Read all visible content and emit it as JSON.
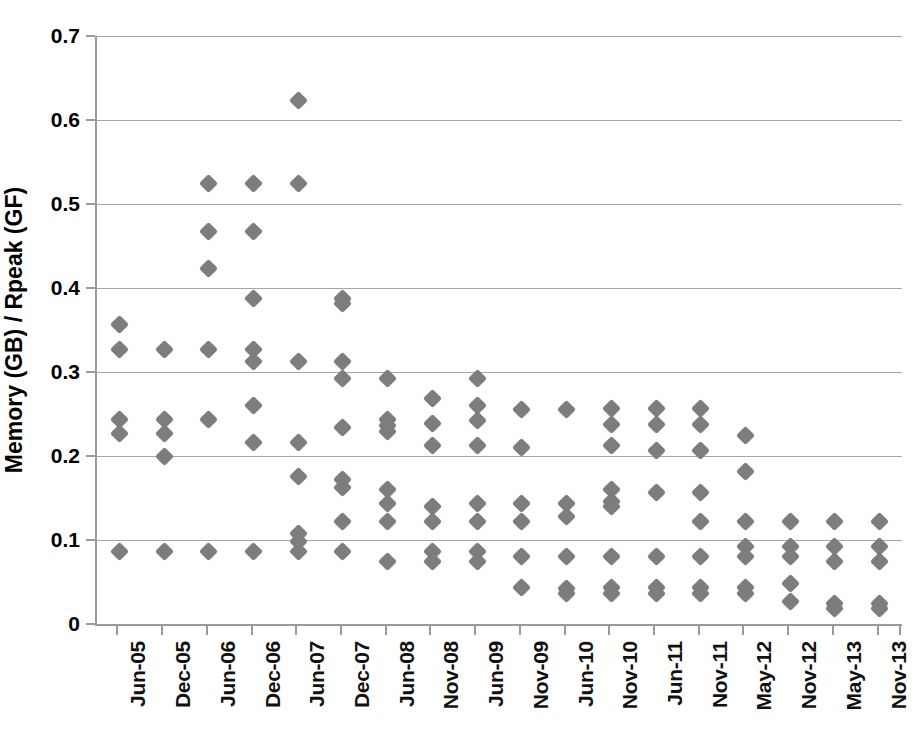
{
  "chart_data": {
    "type": "scatter",
    "title": "",
    "xlabel": "",
    "ylabel": "Memory (GB) / Rpeak (GF)",
    "ylim": [
      0,
      0.7
    ],
    "ytick_labels": [
      "0",
      "0.1",
      "0.2",
      "0.3",
      "0.4",
      "0.5",
      "0.6",
      "0.7"
    ],
    "ytick_values": [
      0,
      0.1,
      0.2,
      0.3,
      0.4,
      0.5,
      0.6,
      0.7
    ],
    "grid": true,
    "legend": "none",
    "marker": "diamond",
    "marker_color": "#7d7d7d",
    "categories": [
      "Jun-05",
      "Dec-05",
      "Jun-06",
      "Dec-06",
      "Jun-07",
      "Dec-07",
      "Jun-08",
      "Nov-08",
      "Jun-09",
      "Nov-09",
      "Jun-10",
      "Nov-10",
      "Jun-11",
      "Nov-11",
      "May-12",
      "Nov-12",
      "May-13",
      "Nov-13"
    ],
    "series": [
      {
        "name": "Memory per peak flop",
        "points_by_category": [
          {
            "category": "Jun-05",
            "values": [
              0.357,
              0.327,
              0.243,
              0.227,
              0.086
            ]
          },
          {
            "category": "Dec-05",
            "values": [
              0.327,
              0.243,
              0.227,
              0.2,
              0.086
            ]
          },
          {
            "category": "Jun-06",
            "values": [
              0.525,
              0.467,
              0.423,
              0.327,
              0.243,
              0.086
            ]
          },
          {
            "category": "Dec-06",
            "values": [
              0.525,
              0.467,
              0.387,
              0.327,
              0.313,
              0.26,
              0.216,
              0.086
            ]
          },
          {
            "category": "Jun-07",
            "values": [
              0.623,
              0.525,
              0.313,
              0.216,
              0.176,
              0.108,
              0.098,
              0.086
            ]
          },
          {
            "category": "Dec-07",
            "values": [
              0.387,
              0.381,
              0.313,
              0.292,
              0.234,
              0.172,
              0.163,
              0.122,
              0.086
            ]
          },
          {
            "category": "Jun-08",
            "values": [
              0.292,
              0.243,
              0.236,
              0.229,
              0.16,
              0.143,
              0.122,
              0.074
            ]
          },
          {
            "category": "Nov-08",
            "values": [
              0.268,
              0.239,
              0.212,
              0.14,
              0.122,
              0.086,
              0.074
            ]
          },
          {
            "category": "Jun-09",
            "values": [
              0.292,
              0.26,
              0.242,
              0.212,
              0.143,
              0.122,
              0.086,
              0.074
            ]
          },
          {
            "category": "Nov-09",
            "values": [
              0.255,
              0.21,
              0.143,
              0.122,
              0.08,
              0.044
            ]
          },
          {
            "category": "Jun-10",
            "values": [
              0.255,
              0.143,
              0.128,
              0.08,
              0.042,
              0.036
            ]
          },
          {
            "category": "Nov-10",
            "values": [
              0.256,
              0.238,
              0.212,
              0.16,
              0.146,
              0.14,
              0.08,
              0.044,
              0.036
            ]
          },
          {
            "category": "Jun-11",
            "values": [
              0.256,
              0.238,
              0.206,
              0.157,
              0.08,
              0.044,
              0.036
            ]
          },
          {
            "category": "Nov-11",
            "values": [
              0.256,
              0.238,
              0.206,
              0.157,
              0.122,
              0.08,
              0.044,
              0.036
            ]
          },
          {
            "category": "May-12",
            "values": [
              0.225,
              0.182,
              0.122,
              0.092,
              0.08,
              0.044,
              0.036
            ]
          },
          {
            "category": "Nov-12",
            "values": [
              0.122,
              0.092,
              0.08,
              0.048,
              0.027
            ]
          },
          {
            "category": "May-13",
            "values": [
              0.122,
              0.092,
              0.075,
              0.024,
              0.018
            ]
          },
          {
            "category": "Nov-13",
            "values": [
              0.122,
              0.092,
              0.075,
              0.024,
              0.018
            ]
          }
        ]
      }
    ]
  }
}
